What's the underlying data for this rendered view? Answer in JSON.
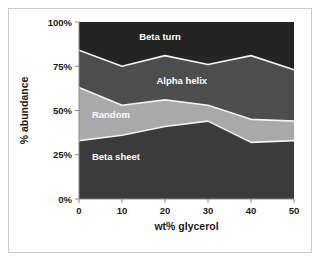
{
  "chart_data": {
    "type": "area",
    "stacked": true,
    "title": "",
    "xlabel": "wt% glycerol",
    "ylabel": "% abundance",
    "x": [
      0,
      10,
      20,
      30,
      40,
      50
    ],
    "xtick_labels": [
      "0",
      "10",
      "20",
      "30",
      "40",
      "50"
    ],
    "xlim": [
      0,
      50
    ],
    "ylim": [
      0,
      100
    ],
    "ytick_labels": [
      "0%",
      "25%",
      "50%",
      "75%",
      "100%"
    ],
    "ytick_values": [
      0,
      25,
      50,
      75,
      100
    ],
    "grid": false,
    "legend_position": "inline-labels",
    "series": [
      {
        "name": "Beta sheet",
        "values": [
          33,
          36,
          41,
          44,
          32,
          33
        ],
        "cumulative_top": [
          33,
          36,
          41,
          44,
          32,
          33
        ],
        "color": "#3b3b3b",
        "label": "Beta sheet"
      },
      {
        "name": "Random",
        "values": [
          30,
          17,
          15,
          9,
          13,
          11
        ],
        "cumulative_top": [
          63,
          53,
          56,
          53,
          45,
          44
        ],
        "color": "#a9a9a9",
        "label": "Random"
      },
      {
        "name": "Alpha helix",
        "values": [
          21,
          22,
          25,
          23,
          36,
          29
        ],
        "cumulative_top": [
          84,
          75,
          81,
          76,
          81,
          73
        ],
        "color": "#4d4d4d",
        "label": "Alpha helix"
      },
      {
        "name": "Beta turn",
        "values": [
          16,
          25,
          19,
          24,
          19,
          27
        ],
        "cumulative_top": [
          100,
          100,
          100,
          100,
          100,
          100
        ],
        "color": "#242424",
        "label": "Beta turn"
      }
    ],
    "series_label_positions": [
      {
        "name": "Beta turn",
        "x": 14,
        "y": 92
      },
      {
        "name": "Alpha helix",
        "x": 18,
        "y": 67
      },
      {
        "name": "Random",
        "x": 3,
        "y": 48
      },
      {
        "name": "Beta sheet",
        "x": 3,
        "y": 24
      }
    ],
    "colors": {
      "beta_turn": "#242424",
      "alpha_helix": "#4d4d4d",
      "random": "#a9a9a9",
      "beta_sheet": "#3b3b3b",
      "band_edge": "#f2f2f2",
      "axis": "#8a8a8a",
      "text": "#1a1a1a",
      "frame_border": "#c9c9c9",
      "background": "#ffffff"
    }
  }
}
